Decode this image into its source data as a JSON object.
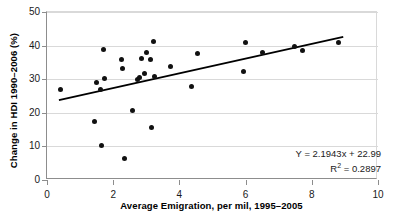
{
  "chart_data": {
    "type": "scatter",
    "title": "",
    "xlabel": "Average Emigration, per mil, 1995–2005",
    "ylabel": "Change in HDI 1990–2006 (%)",
    "xlim": [
      0,
      10
    ],
    "ylim": [
      0,
      50
    ],
    "xticks": [
      0,
      2,
      4,
      6,
      8,
      10
    ],
    "yticks": [
      0,
      10,
      20,
      30,
      40,
      50
    ],
    "xtick_labels": [
      "0",
      "2",
      "4",
      "6",
      "8",
      "10"
    ],
    "ytick_labels": [
      "0",
      "10",
      "20",
      "30",
      "40",
      "50"
    ],
    "grid": "horizontal",
    "legend": "none",
    "marker_color": "#111111",
    "grid_color": "#d9d9d9",
    "axis_color": "#8d8d8d",
    "trendline": {
      "equation_label": "Y = 2.1943x + 22.99",
      "r2_label_prefix": "R",
      "r2_label_sup": "2",
      "r2_label_value": " = 0.2897",
      "slope": 2.1943,
      "intercept": 22.99,
      "r_squared": 0.2897,
      "color": "#000000",
      "x_start": 0.36,
      "x_end": 8.95
    },
    "points": [
      {
        "x": 0.42,
        "y": 26.9
      },
      {
        "x": 1.44,
        "y": 17.5
      },
      {
        "x": 1.5,
        "y": 29.0
      },
      {
        "x": 1.61,
        "y": 26.8
      },
      {
        "x": 1.66,
        "y": 10.2
      },
      {
        "x": 1.73,
        "y": 30.3
      },
      {
        "x": 1.72,
        "y": 38.7
      },
      {
        "x": 2.26,
        "y": 35.9
      },
      {
        "x": 2.28,
        "y": 33.2
      },
      {
        "x": 2.33,
        "y": 6.3
      },
      {
        "x": 2.59,
        "y": 20.7
      },
      {
        "x": 2.72,
        "y": 30.0
      },
      {
        "x": 2.8,
        "y": 30.4
      },
      {
        "x": 2.84,
        "y": 36.3
      },
      {
        "x": 2.94,
        "y": 31.7
      },
      {
        "x": 3.02,
        "y": 37.9
      },
      {
        "x": 3.12,
        "y": 35.9
      },
      {
        "x": 3.15,
        "y": 15.5
      },
      {
        "x": 3.22,
        "y": 41.2
      },
      {
        "x": 3.26,
        "y": 30.7
      },
      {
        "x": 3.72,
        "y": 33.9
      },
      {
        "x": 4.36,
        "y": 27.7
      },
      {
        "x": 4.56,
        "y": 37.7
      },
      {
        "x": 5.95,
        "y": 32.3
      },
      {
        "x": 5.99,
        "y": 40.9
      },
      {
        "x": 6.52,
        "y": 37.8
      },
      {
        "x": 7.48,
        "y": 39.6
      },
      {
        "x": 7.72,
        "y": 38.4
      },
      {
        "x": 8.8,
        "y": 40.8
      }
    ]
  }
}
